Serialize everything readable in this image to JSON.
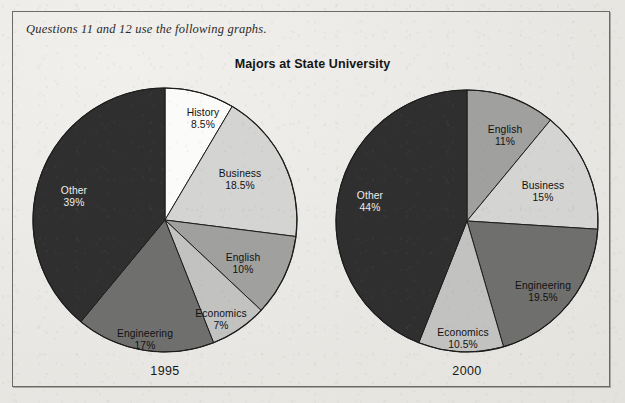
{
  "prompt": "Questions 11 and 12 use the following graphs.",
  "title": "Majors at State University",
  "colors": {
    "white_slice": "#fbfbfa",
    "very_light_gray": "#d4d4d2",
    "light_gray": "#c2c2c0",
    "medium_gray": "#a0a09e",
    "dark_gray": "#6f6f6e",
    "near_black": "#2f2f2f",
    "outline": "#1d1d1d",
    "frame": "#6c6a66",
    "paper": "#eceae6"
  },
  "chart_data": [
    {
      "type": "pie",
      "title": "Majors at State University",
      "year": "1995",
      "name": "1995",
      "start_angle_deg": 0,
      "direction": "clockwise",
      "units": "percent",
      "categories": [
        "History",
        "Business",
        "English",
        "Economics",
        "Engineering",
        "Other"
      ],
      "values": [
        8.5,
        18.5,
        10,
        7,
        17,
        39
      ],
      "slices": [
        {
          "label": "History",
          "pct": 8.5,
          "pct_text": "8.5%",
          "fill": "#fbfbfa",
          "text_color": "#111111"
        },
        {
          "label": "Business",
          "pct": 18.5,
          "pct_text": "18.5%",
          "fill": "#d4d4d2",
          "text_color": "#111111"
        },
        {
          "label": "English",
          "pct": 10,
          "pct_text": "10%",
          "fill": "#a0a09e",
          "text_color": "#111111"
        },
        {
          "label": "Economics",
          "pct": 7,
          "pct_text": "7%",
          "fill": "#c2c2c0",
          "text_color": "#111111"
        },
        {
          "label": "Engineering",
          "pct": 17,
          "pct_text": "17%",
          "fill": "#6f6f6e",
          "text_color": "#111111"
        },
        {
          "label": "Other",
          "pct": 39,
          "pct_text": "39%",
          "fill": "#2f2f2f",
          "text_color": "#ececec"
        }
      ]
    },
    {
      "type": "pie",
      "title": "Majors at State University",
      "year": "2000",
      "name": "2000",
      "start_angle_deg": 0,
      "direction": "clockwise",
      "units": "percent",
      "categories": [
        "English",
        "Business",
        "Engineering",
        "Economics",
        "Other"
      ],
      "values": [
        11,
        15,
        19.5,
        10.5,
        44
      ],
      "slices": [
        {
          "label": "English",
          "pct": 11,
          "pct_text": "11%",
          "fill": "#a0a09e",
          "text_color": "#111111"
        },
        {
          "label": "Business",
          "pct": 15,
          "pct_text": "15%",
          "fill": "#d4d4d2",
          "text_color": "#111111"
        },
        {
          "label": "Engineering",
          "pct": 19.5,
          "pct_text": "19.5%",
          "fill": "#6f6f6e",
          "text_color": "#111111"
        },
        {
          "label": "Economics",
          "pct": 10.5,
          "pct_text": "10.5%",
          "fill": "#c2c2c0",
          "text_color": "#111111"
        },
        {
          "label": "Other",
          "pct": 44,
          "pct_text": "44%",
          "fill": "#2f2f2f",
          "text_color": "#ececec"
        }
      ]
    }
  ],
  "pie_left": {
    "year": "1995",
    "labels": [
      {
        "name": "History",
        "pct": "8.5%",
        "x": 203,
        "y": 107,
        "tone": "dark"
      },
      {
        "name": "Business",
        "pct": "18.5%",
        "x": 240,
        "y": 168,
        "tone": "dark"
      },
      {
        "name": "English",
        "pct": "10%",
        "x": 243,
        "y": 252,
        "tone": "dark"
      },
      {
        "name": "Economics",
        "pct": "7%",
        "x": 221,
        "y": 308,
        "tone": "dark"
      },
      {
        "name": "Engineering",
        "pct": "17%",
        "x": 145,
        "y": 328,
        "tone": "dark"
      },
      {
        "name": "Other",
        "pct": "39%",
        "x": 74,
        "y": 185,
        "tone": "light"
      }
    ]
  },
  "pie_right": {
    "year": "2000",
    "labels": [
      {
        "name": "English",
        "pct": "11%",
        "x": 505,
        "y": 124,
        "tone": "dark"
      },
      {
        "name": "Business",
        "pct": "15%",
        "x": 543,
        "y": 180,
        "tone": "dark"
      },
      {
        "name": "Engineering",
        "pct": "19.5%",
        "x": 543,
        "y": 280,
        "tone": "dark"
      },
      {
        "name": "Economics",
        "pct": "10.5%",
        "x": 463,
        "y": 327,
        "tone": "dark"
      },
      {
        "name": "Other",
        "pct": "44%",
        "x": 370,
        "y": 190,
        "tone": "light"
      }
    ]
  },
  "geometry": {
    "left_center_x": 165,
    "left_center_y": 220,
    "left_radius": 132,
    "right_center_x": 467,
    "right_center_y": 221,
    "right_radius": 131,
    "year_label_y": 364
  }
}
